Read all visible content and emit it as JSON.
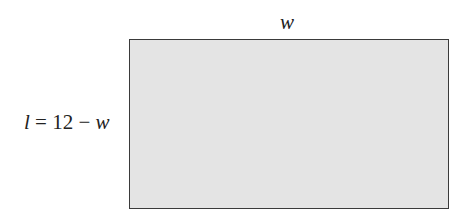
{
  "diagram": {
    "shape": "rectangle",
    "fill_color": "#e4e4e4",
    "border_color": "#3a3a3a",
    "top_label": "w",
    "side_label": {
      "variable": "l",
      "equals": " = 12 − ",
      "operand": "w"
    }
  }
}
